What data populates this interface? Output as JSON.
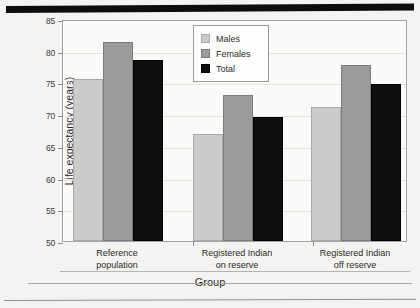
{
  "chart_data": {
    "type": "bar",
    "title": "",
    "xlabel": "Group",
    "ylabel": "Life expectancy (years)",
    "ylim": [
      50,
      85
    ],
    "yticks": [
      50,
      55,
      60,
      65,
      70,
      75,
      80,
      85
    ],
    "ytick_labels": [
      "50",
      "55",
      "60",
      "65",
      "70",
      "75",
      "80",
      "85"
    ],
    "grid": true,
    "legend_position": "top-center",
    "categories": [
      "Reference population",
      "Registered Indian on reserve",
      "Registered Indian off reserve"
    ],
    "category_lines": [
      [
        "Reference",
        "population"
      ],
      [
        "Registered Indian",
        "on reserve"
      ],
      [
        "Registered Indian",
        "off reserve"
      ]
    ],
    "series": [
      {
        "name": "Males",
        "color": "#cbcbc9",
        "values": [
          75.6,
          66.8,
          71.2
        ]
      },
      {
        "name": "Females",
        "color": "#9b9b99",
        "values": [
          81.4,
          73.0,
          77.7
        ]
      },
      {
        "name": "Total",
        "color": "#100f0f",
        "values": [
          78.5,
          69.5,
          74.8
        ]
      }
    ]
  },
  "legend": {
    "items": [
      {
        "label": "Males"
      },
      {
        "label": "Females"
      },
      {
        "label": "Total"
      }
    ]
  }
}
